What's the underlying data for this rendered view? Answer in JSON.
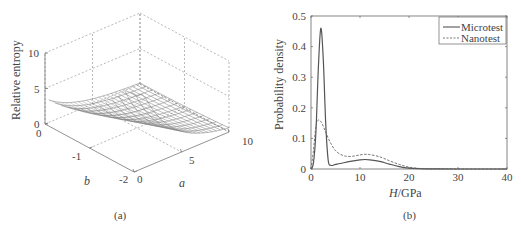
{
  "chart_data": [
    {
      "id": "a",
      "type": "surface3d",
      "caption": "(a)",
      "zlabel": "Relative entropy",
      "xlabel": "a",
      "ylabel": "b",
      "x_ticks": [
        "0",
        "5",
        "10"
      ],
      "y_ticks": [
        "0",
        "-1",
        "-2"
      ],
      "z_ticks": [
        "0",
        "5",
        "10"
      ],
      "xlim": [
        0,
        10
      ],
      "ylim": [
        -2,
        0
      ],
      "zlim": [
        0,
        10
      ],
      "grid": true,
      "description": "Mesh surface; relative entropy highest (~10) at small a and b near -2, decaying toward ~0 as a increases to 10"
    },
    {
      "id": "b",
      "type": "line",
      "caption": "(b)",
      "xlabel": "H/GPa",
      "xlabel_italic_part": "H",
      "xlabel_rest": "/GPa",
      "ylabel": "Probability density",
      "xlim": [
        0,
        40
      ],
      "ylim": [
        0,
        0.5
      ],
      "x_ticks": [
        "0",
        "10",
        "20",
        "30",
        "40"
      ],
      "y_ticks": [
        "0",
        "0.1",
        "0.2",
        "0.3",
        "0.4",
        "0.5"
      ],
      "grid": false,
      "legend_position": "upper right",
      "series": [
        {
          "name": "Microtest",
          "style": "solid",
          "x": [
            0,
            0.5,
            1,
            1.5,
            2,
            2.5,
            3,
            3.5,
            4,
            5,
            6,
            8,
            10,
            11,
            12,
            14,
            16,
            18,
            20,
            22,
            24,
            26,
            30,
            35,
            40
          ],
          "y": [
            0,
            0.02,
            0.12,
            0.33,
            0.46,
            0.36,
            0.15,
            0.03,
            0.012,
            0.015,
            0.018,
            0.025,
            0.03,
            0.031,
            0.03,
            0.025,
            0.016,
            0.008,
            0.003,
            0.001,
            0.0004,
            0.0001,
            0,
            0,
            0
          ]
        },
        {
          "name": "Nanotest",
          "style": "dashed",
          "x": [
            0,
            0.5,
            1,
            1.5,
            2,
            2.5,
            3,
            4,
            5,
            6,
            7,
            8,
            9,
            10,
            11,
            12,
            14,
            16,
            18,
            20,
            22,
            24,
            26,
            30,
            35,
            40
          ],
          "y": [
            0,
            0.06,
            0.14,
            0.16,
            0.155,
            0.14,
            0.12,
            0.085,
            0.06,
            0.048,
            0.042,
            0.041,
            0.043,
            0.046,
            0.048,
            0.047,
            0.04,
            0.027,
            0.015,
            0.006,
            0.002,
            0.0006,
            0.0002,
            0,
            0,
            0
          ]
        }
      ]
    }
  ]
}
